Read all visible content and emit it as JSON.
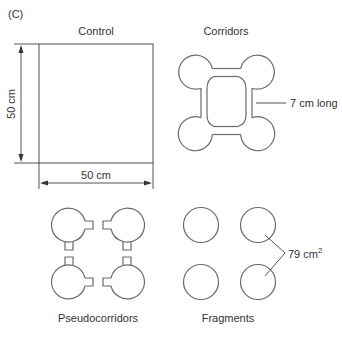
{
  "figure": {
    "panel_label": "(C)",
    "stroke_color": "#6a6a6a",
    "text_color": "#333333"
  },
  "panels": {
    "control": {
      "title": "Control",
      "height_label": "50 cm",
      "width_label": "50 cm"
    },
    "corridors": {
      "title": "Corridors",
      "annotation": "7 cm long"
    },
    "pseudocorridors": {
      "title": "Pseudocorridors"
    },
    "fragments": {
      "title": "Fragments",
      "annotation_value": "79 cm",
      "annotation_superscript": "2"
    }
  }
}
